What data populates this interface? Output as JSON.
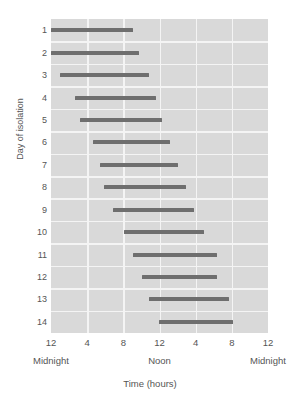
{
  "chart_data": {
    "type": "bar",
    "orientation": "horizontal",
    "title": "",
    "xlabel": "Time (hours)",
    "ylabel": "Day of isolation",
    "xlim": [
      0,
      24
    ],
    "ylim": [
      0.5,
      14.5
    ],
    "grid": true,
    "legend": null,
    "panel_background": "#d9d9d9",
    "grid_color": "#f4f4f4",
    "bar_color": "#6e6e6e",
    "text_color": "#555555",
    "x_ticks": [
      {
        "value": 0,
        "label": "12"
      },
      {
        "value": 4,
        "label": "4"
      },
      {
        "value": 8,
        "label": "8"
      },
      {
        "value": 12,
        "label": "12"
      },
      {
        "value": 16,
        "label": "4"
      },
      {
        "value": 20,
        "label": "8"
      },
      {
        "value": 24,
        "label": "12"
      }
    ],
    "x_secondary_labels": [
      {
        "value": 0,
        "label": "Midnight"
      },
      {
        "value": 12,
        "label": "Noon"
      },
      {
        "value": 24,
        "label": "Midnight"
      }
    ],
    "categories": [
      "1",
      "2",
      "3",
      "4",
      "5",
      "6",
      "7",
      "8",
      "9",
      "10",
      "11",
      "12",
      "13",
      "14"
    ],
    "series": [
      {
        "name": "Sleep episode",
        "units": "hours from midnight",
        "intervals": [
          {
            "day": 1,
            "start": 0.0,
            "end": 9.1
          },
          {
            "day": 2,
            "start": 0.0,
            "end": 9.7
          },
          {
            "day": 3,
            "start": 1.0,
            "end": 10.8
          },
          {
            "day": 4,
            "start": 2.6,
            "end": 11.6
          },
          {
            "day": 5,
            "start": 3.2,
            "end": 12.3
          },
          {
            "day": 6,
            "start": 4.6,
            "end": 13.2
          },
          {
            "day": 7,
            "start": 5.4,
            "end": 14.0
          },
          {
            "day": 8,
            "start": 5.9,
            "end": 14.9
          },
          {
            "day": 9,
            "start": 6.9,
            "end": 15.8
          },
          {
            "day": 10,
            "start": 8.1,
            "end": 16.9
          },
          {
            "day": 11,
            "start": 9.1,
            "end": 18.4
          },
          {
            "day": 12,
            "start": 10.1,
            "end": 18.4
          },
          {
            "day": 13,
            "start": 10.8,
            "end": 19.7
          },
          {
            "day": 14,
            "start": 11.9,
            "end": 20.1
          }
        ]
      }
    ],
    "y_tick_labels": [
      "1",
      "2",
      "3",
      "4",
      "5",
      "6",
      "7",
      "8",
      "9",
      "10",
      "11",
      "12",
      "13",
      "14"
    ]
  }
}
